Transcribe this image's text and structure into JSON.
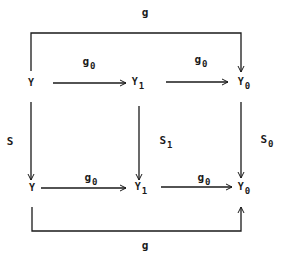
{
  "diagram": {
    "type": "commutative-diagram",
    "stroke_color": "#1a1a1a",
    "background": "#ffffff",
    "top_label": {
      "base": "g",
      "sub": ""
    },
    "bottom_label": {
      "base": "g",
      "sub": ""
    },
    "nodes": {
      "top_left": {
        "base": "Y",
        "sub": ""
      },
      "top_mid": {
        "base": "Y",
        "sub": "1"
      },
      "top_right": {
        "base": "Y",
        "sub": "0"
      },
      "bot_left": {
        "base": "Y",
        "sub": ""
      },
      "bot_mid": {
        "base": "Y",
        "sub": "1"
      },
      "bot_right": {
        "base": "Y",
        "sub": "0"
      }
    },
    "edge_labels": {
      "top_left_mid": {
        "base": "g",
        "sub": "0"
      },
      "top_mid_right": {
        "base": "g",
        "sub": "0"
      },
      "bot_left_mid": {
        "base": "g",
        "sub": "0"
      },
      "bot_mid_right": {
        "base": "g",
        "sub": "0"
      },
      "left_vertical": {
        "base": "S",
        "sub": ""
      },
      "mid_vertical": {
        "base": "S",
        "sub": "1"
      },
      "right_vertical": {
        "base": "S",
        "sub": "0"
      }
    },
    "edges": [
      {
        "from": "top_left",
        "to": "top_mid",
        "label": "g0"
      },
      {
        "from": "top_mid",
        "to": "top_right",
        "label": "g0"
      },
      {
        "from": "bot_left",
        "to": "bot_mid",
        "label": "g0"
      },
      {
        "from": "bot_mid",
        "to": "bot_right",
        "label": "g0"
      },
      {
        "from": "top_left",
        "to": "bot_left",
        "label": "S"
      },
      {
        "from": "top_mid",
        "to": "bot_mid",
        "label": "S1"
      },
      {
        "from": "top_right",
        "to": "bot_right",
        "label": "S0"
      },
      {
        "from": "top_left",
        "to": "top_right",
        "label": "g",
        "routing": "bracket-over"
      },
      {
        "from": "bot_left",
        "to": "bot_right",
        "label": "g",
        "routing": "bracket-under"
      }
    ]
  }
}
